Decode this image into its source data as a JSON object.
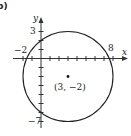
{
  "panel_label": "b)",
  "axes": {
    "x_label": "x",
    "y_label": "y",
    "tick_labels": {
      "x_left": "−2",
      "x_right": "8",
      "y_top": "3",
      "y_bottom": "−7"
    }
  },
  "circle": {
    "center_label": "(3, −2)",
    "center": [
      3,
      -2
    ],
    "radius": 5
  }
}
